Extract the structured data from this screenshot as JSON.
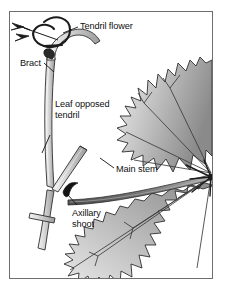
{
  "figure": {
    "background_color": "#ffffff",
    "border_color": "#6e6e6e",
    "ink_color": "#111111",
    "leaf_fill_light": "#e4e4e4",
    "leaf_fill_dark": "#8d8d8d",
    "stem_fill_light": "#efefef",
    "stem_fill_dark": "#9a9a9a"
  },
  "labels": {
    "tendril_flower": "Tendril flower",
    "bract": "Bract",
    "leaf_opposed_tendril_line1": "Leaf opposed",
    "leaf_opposed_tendril_line2": "tendril",
    "main_stem": "Main stem",
    "axillary_shoot_line1": "Axillary",
    "axillary_shoot_line2": "shoot"
  },
  "parts": {
    "tendril_flower": "tendril-flower-coil",
    "bract": "bract-scale",
    "leaf_opposed_tendril": "leaf-opposed-tendril-stalk",
    "main_stem": "main-stem-cane",
    "axillary_shoot": "axillary-shoot-bud",
    "leaf_upper": "grape-leaf-upper",
    "leaf_lower": "grape-leaf-lower",
    "petiole": "leaf-petiole",
    "vein_node": "vein-junction-node"
  }
}
